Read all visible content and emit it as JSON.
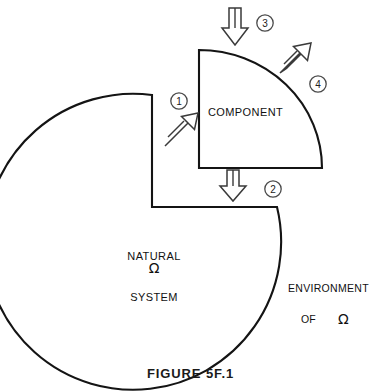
{
  "figure": {
    "caption": "FIGURE 5F.1",
    "type": "system-boundary-diagram"
  },
  "diagram": {
    "component": {
      "label": "COMPONENT",
      "shape": "quarter-circle-sector"
    },
    "natural_system": {
      "label_line1": "NATURAL",
      "label_line2": "SYSTEM",
      "symbol": "Ω",
      "shape": "circle-with-notch"
    },
    "environment": {
      "label_line1": "ENVIRONMENT",
      "label_of": "OF",
      "symbol": "Ω"
    },
    "flows": [
      {
        "id": "1",
        "badge": "1",
        "direction": "up-right",
        "description": "flow from natural system into component"
      },
      {
        "id": "2",
        "badge": "2",
        "direction": "down",
        "description": "flow from component into natural system"
      },
      {
        "id": "3",
        "badge": "3",
        "direction": "down",
        "description": "flow from environment into component"
      },
      {
        "id": "4",
        "badge": "4",
        "direction": "up-right",
        "description": "flow from component into environment"
      }
    ]
  },
  "style": {
    "stroke": "#141414",
    "background": "#ffffff"
  }
}
